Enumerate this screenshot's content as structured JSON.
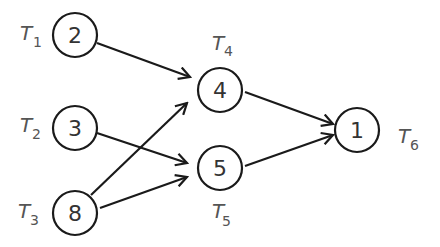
{
  "diagram": {
    "type": "task-dependency-graph",
    "nodes": [
      {
        "id": "T1",
        "weight": "2",
        "label": "T",
        "sub": "1",
        "cx": 75,
        "cy": 35
      },
      {
        "id": "T2",
        "weight": "3",
        "label": "T",
        "sub": "2",
        "cx": 75,
        "cy": 128
      },
      {
        "id": "T3",
        "weight": "8",
        "label": "T",
        "sub": "3",
        "cx": 75,
        "cy": 213
      },
      {
        "id": "T4",
        "weight": "4",
        "label": "T",
        "sub": "4",
        "cx": 220,
        "cy": 90
      },
      {
        "id": "T5",
        "weight": "5",
        "label": "T",
        "sub": "5",
        "cx": 220,
        "cy": 168
      },
      {
        "id": "T6",
        "weight": "1",
        "label": "T",
        "sub": "6",
        "cx": 363,
        "cy": 130
      }
    ],
    "edges": [
      {
        "from": "T1",
        "to": "T4"
      },
      {
        "from": "T2",
        "to": "T5"
      },
      {
        "from": "T3",
        "to": "T4"
      },
      {
        "from": "T3",
        "to": "T5"
      },
      {
        "from": "T4",
        "to": "T6"
      },
      {
        "from": "T5",
        "to": "T6"
      }
    ]
  }
}
